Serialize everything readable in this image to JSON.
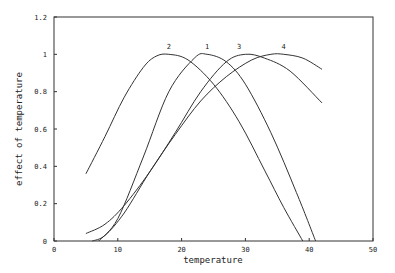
{
  "chart_data": {
    "type": "line",
    "title": "",
    "xlabel": "temperature",
    "ylabel": "effect of temperature",
    "xlim": [
      0,
      50
    ],
    "ylim": [
      0,
      1.2
    ],
    "xticks": [
      "0",
      "10",
      "20",
      "30",
      "40",
      "50"
    ],
    "yticks": [
      "0",
      "0.2",
      "0.4",
      "0.6",
      "0.8",
      "1",
      "1.2"
    ],
    "grid": false,
    "legend": "inline curve labels",
    "series": [
      {
        "name": "1",
        "x": [
          7,
          10,
          14,
          18,
          22,
          24,
          27,
          30,
          34,
          38,
          41
        ],
        "values": [
          0,
          0.12,
          0.45,
          0.8,
          0.98,
          1.0,
          0.96,
          0.84,
          0.58,
          0.26,
          0
        ]
      },
      {
        "name": "2",
        "x": [
          5,
          8,
          11,
          14,
          16,
          18,
          21,
          25,
          29,
          33,
          36,
          39
        ],
        "values": [
          0.36,
          0.56,
          0.77,
          0.93,
          0.99,
          1.0,
          0.97,
          0.84,
          0.64,
          0.38,
          0.18,
          0
        ]
      },
      {
        "name": "3",
        "x": [
          5,
          8,
          11,
          15,
          19,
          23,
          27,
          30,
          33,
          37,
          42
        ],
        "values": [
          0.04,
          0.09,
          0.19,
          0.37,
          0.58,
          0.8,
          0.96,
          1.0,
          0.98,
          0.91,
          0.74
        ]
      },
      {
        "name": "4",
        "x": [
          6,
          8,
          11,
          15,
          19,
          23,
          27,
          31,
          34,
          36,
          39,
          42
        ],
        "values": [
          0,
          0.03,
          0.15,
          0.37,
          0.57,
          0.75,
          0.88,
          0.97,
          1.0,
          1.0,
          0.98,
          0.92
        ]
      }
    ],
    "curve_labels": [
      {
        "text": "2",
        "x": 18,
        "y": 1.03
      },
      {
        "text": "1",
        "x": 24,
        "y": 1.03
      },
      {
        "text": "3",
        "x": 29,
        "y": 1.03
      },
      {
        "text": "4",
        "x": 36,
        "y": 1.03
      }
    ]
  }
}
